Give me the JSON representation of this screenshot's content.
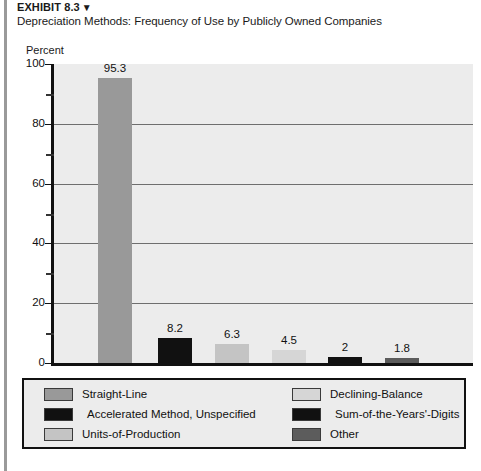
{
  "header": {
    "exhibit_label": "EXHIBIT 8.3",
    "exhibit_marker": "▼",
    "subtitle": "Depreciation Methods: Frequency of Use by Publicly Owned Companies"
  },
  "chart_data": {
    "type": "bar",
    "title": "Depreciation Methods: Frequency of Use by Publicly Owned Companies",
    "xlabel": "",
    "ylabel": "Percent",
    "ylim": [
      0,
      100
    ],
    "grid": true,
    "legend_position": "below",
    "ytick_labels": [
      "100",
      "80",
      "60",
      "40",
      "20",
      "0"
    ],
    "ytick_values": [
      100,
      80,
      60,
      40,
      20,
      0
    ],
    "yminor_ticks": [
      90,
      70,
      50,
      30,
      10
    ],
    "categories": [
      "Straight-Line",
      "Accelerated Method, Unspecified",
      "Units-of-Production",
      "Declining-Balance",
      "Sum-of-the-Years'-Digits",
      "Other"
    ],
    "values": [
      95.3,
      8.2,
      6.3,
      4.5,
      2,
      1.8
    ],
    "value_labels": [
      "95.3",
      "8.2",
      "6.3",
      "4.5",
      "2",
      "1.8"
    ],
    "colors": [
      "#999999",
      "#111111",
      "#c4c4c4",
      "#d6d6d6",
      "#111111",
      "#5c5c5c"
    ]
  },
  "legend": {
    "entries": [
      {
        "label": "Straight-Line",
        "color": "#999999"
      },
      {
        "label": "Accelerated Method, Unspecified",
        "color": "#111111"
      },
      {
        "label": "Units-of-Production",
        "color": "#c4c4c4"
      },
      {
        "label": "Declining-Balance",
        "color": "#d6d6d6"
      },
      {
        "label": "Sum-of-the-Years'-Digits",
        "color": "#111111"
      },
      {
        "label": "Other",
        "color": "#5c5c5c"
      }
    ]
  }
}
